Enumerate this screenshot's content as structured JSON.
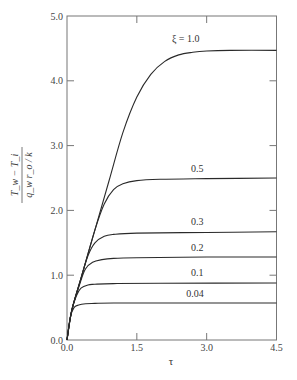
{
  "chart_data": {
    "type": "line",
    "title": "",
    "xlabel": "τ",
    "ylabel": "(T_w − T_i) / (q_w r_o / k)",
    "ylabel_parts": {
      "numerator": "T_w − T_i",
      "denominator": "q_w r_o / k"
    },
    "xlim": [
      0.0,
      4.5
    ],
    "ylim": [
      0.0,
      5.0
    ],
    "xticks": [
      "0.0",
      "1.5",
      "3.0",
      "4.5"
    ],
    "yticks": [
      "0.0",
      "1.0",
      "2.0",
      "3.0",
      "4.0",
      "5.0"
    ],
    "grid": false,
    "legend": "inline curve labels at right",
    "series": [
      {
        "name": "ξ = 1.0",
        "label": "ξ = 1.0",
        "plateau": 4.47,
        "x": [
          0,
          0.1,
          0.3,
          0.6,
          0.9,
          1.2,
          1.5,
          1.8,
          2.1,
          2.4,
          2.7,
          3.0,
          3.5,
          4.5
        ],
        "y": [
          0,
          0.45,
          0.95,
          1.7,
          2.45,
          3.2,
          3.75,
          4.1,
          4.3,
          4.4,
          4.44,
          4.46,
          4.47,
          4.47
        ]
      },
      {
        "name": "ξ = 0.5",
        "label": "0.5",
        "plateau": 2.5,
        "x": [
          0,
          0.1,
          0.3,
          0.6,
          0.8,
          1.0,
          1.2,
          1.5,
          2.0,
          3.0,
          4.5
        ],
        "y": [
          0,
          0.45,
          0.95,
          1.7,
          2.1,
          2.32,
          2.41,
          2.46,
          2.48,
          2.49,
          2.5
        ]
      },
      {
        "name": "ξ = 0.3",
        "label": "0.3",
        "plateau": 1.67,
        "x": [
          0,
          0.1,
          0.3,
          0.45,
          0.6,
          0.8,
          1.0,
          1.5,
          3.0,
          4.5
        ],
        "y": [
          0,
          0.45,
          0.95,
          1.3,
          1.5,
          1.6,
          1.63,
          1.65,
          1.66,
          1.67
        ]
      },
      {
        "name": "ξ = 0.2",
        "label": "0.2",
        "plateau": 1.28,
        "x": [
          0,
          0.1,
          0.3,
          0.4,
          0.55,
          0.75,
          1.0,
          1.5,
          3.0,
          4.5
        ],
        "y": [
          0,
          0.45,
          0.92,
          1.1,
          1.2,
          1.24,
          1.26,
          1.27,
          1.28,
          1.28
        ]
      },
      {
        "name": "ξ = 0.1",
        "label": "0.1",
        "plateau": 0.88,
        "x": [
          0,
          0.1,
          0.2,
          0.3,
          0.45,
          0.6,
          1.0,
          2.0,
          4.5
        ],
        "y": [
          0,
          0.45,
          0.68,
          0.8,
          0.85,
          0.86,
          0.87,
          0.875,
          0.88
        ]
      },
      {
        "name": "ξ = 0.04",
        "label": "0.04",
        "plateau": 0.57,
        "x": [
          0,
          0.07,
          0.15,
          0.25,
          0.4,
          0.6,
          1.0,
          2.0,
          4.5
        ],
        "y": [
          0,
          0.35,
          0.5,
          0.54,
          0.56,
          0.565,
          0.57,
          0.57,
          0.57
        ]
      }
    ],
    "label_positions": [
      {
        "text": "ξ = 1.0",
        "x": 2.55,
        "y": 4.6
      },
      {
        "text": "0.5",
        "x": 2.8,
        "y": 2.6
      },
      {
        "text": "0.3",
        "x": 2.8,
        "y": 1.77
      },
      {
        "text": "0.2",
        "x": 2.8,
        "y": 1.38
      },
      {
        "text": "0.1",
        "x": 2.8,
        "y": 0.98
      },
      {
        "text": "0.04",
        "x": 2.75,
        "y": 0.67
      }
    ]
  },
  "colors": {
    "curve": "#2a2a2a",
    "axis": "#777777",
    "text": "#444444",
    "background": "#ffffff"
  }
}
